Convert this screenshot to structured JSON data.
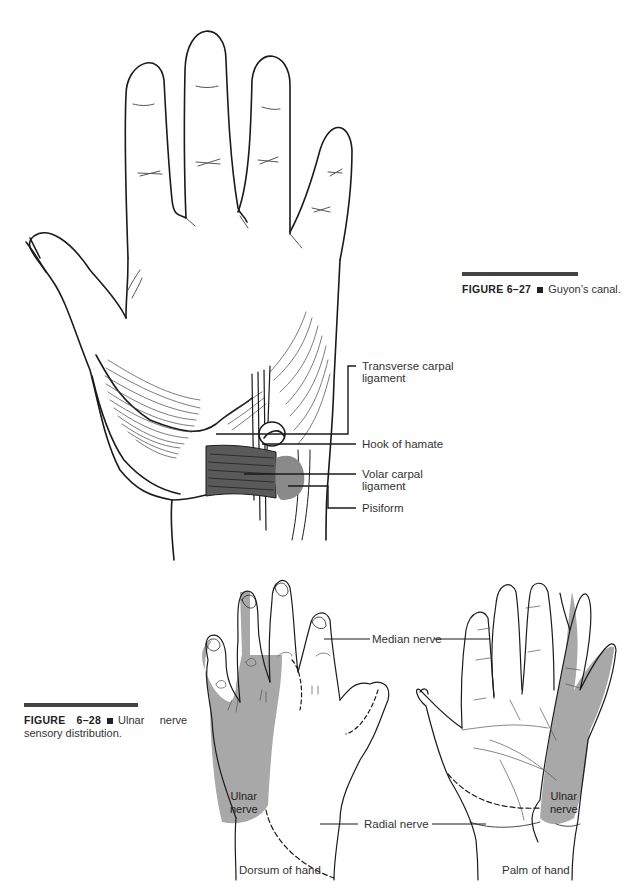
{
  "figure_27": {
    "number": "FIGURE 6–27",
    "title": "Guyon’s canal.",
    "labels": {
      "transverse_carpal_ligament": [
        "Transverse carpal",
        "ligament"
      ],
      "hook_of_hamate": "Hook of hamate",
      "volar_carpal_ligament": [
        "Volar carpal",
        "ligament"
      ],
      "pisiform": "Pisiform"
    }
  },
  "figure_28": {
    "number": "FIGURE",
    "number_2": "6–28",
    "title_line1": "Ulnar     nerve",
    "title_line2": "sensory distribution.",
    "labels": {
      "median_nerve": "Median nerve",
      "radial_nerve": "Radial nerve",
      "ulnar_nerve_dorsum": [
        "Ulnar",
        "nerve"
      ],
      "ulnar_nerve_palm": [
        "Ulnar",
        "nerve"
      ],
      "dorsum_of_hand": "Dorsum of hand",
      "palm_of_hand": "Palm of hand"
    }
  },
  "colors": {
    "line": "#1a1a1a",
    "shade_dark": "#5a5a5a",
    "shade_light": "#a8a8a8",
    "rule": "#444444"
  }
}
